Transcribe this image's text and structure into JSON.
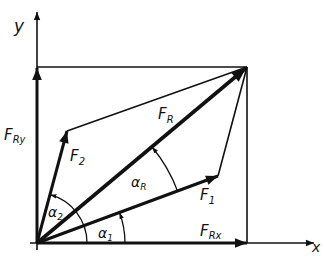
{
  "colors": {
    "ink": "#111111",
    "background": "#ffffff"
  },
  "labels": {
    "y_axis": "y",
    "x_axis": "x",
    "FR": "F",
    "FR_sub": "R",
    "F1": "F",
    "F1_sub": "1",
    "F2": "F",
    "F2_sub": "2",
    "FRx": "F",
    "FRx_sub": "Rx",
    "FRy": "F",
    "FRy_sub": "Ry",
    "alpha1": "α",
    "alpha1_sub": "1",
    "alpha2": "α",
    "alpha2_sub": "2",
    "alphaR": "α",
    "alphaR_sub": "R"
  },
  "geometry": {
    "origin": [
      37,
      243
    ],
    "FR_tip": [
      247,
      67
    ],
    "F1_tip": [
      218,
      176
    ],
    "F2_tip": [
      67,
      131
    ],
    "x_axis_end": [
      312,
      243
    ],
    "y_axis_end": [
      37,
      10
    ]
  }
}
